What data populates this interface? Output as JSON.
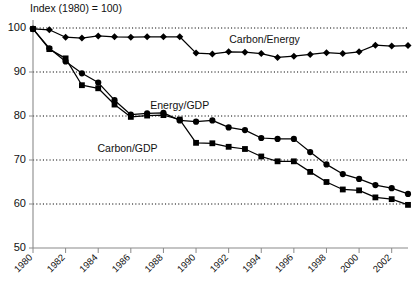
{
  "chart_data": {
    "type": "line",
    "title": "Index (1980) = 100)",
    "xlabel": "",
    "ylabel": "",
    "ylim": [
      50,
      100
    ],
    "xlim": [
      1980,
      2003
    ],
    "grid": true,
    "gridlines_y": [
      60,
      70,
      80,
      90,
      100
    ],
    "y_ticks": [
      50,
      60,
      70,
      80,
      90,
      100
    ],
    "y_tick_labels": [
      "50",
      "60",
      "70",
      "80",
      "90",
      "100"
    ],
    "x_ticks": [
      1980,
      1982,
      1984,
      1986,
      1988,
      1990,
      1992,
      1994,
      1996,
      1998,
      2000,
      2002
    ],
    "x_tick_labels": [
      "1980",
      "1982",
      "1984",
      "1986",
      "1988",
      "1990",
      "1992",
      "1994",
      "1996",
      "1998",
      "2000",
      "2002"
    ],
    "x": [
      1980,
      1981,
      1982,
      1983,
      1984,
      1985,
      1986,
      1987,
      1988,
      1989,
      1990,
      1991,
      1992,
      1993,
      1994,
      1995,
      1996,
      1997,
      1998,
      1999,
      2000,
      2001,
      2002,
      2003
    ],
    "legend_position": "inline-annotations",
    "series": [
      {
        "name": "Carbon/Energy",
        "marker": "diamond",
        "label_x": 1994.2,
        "label_y": 96.7,
        "values": [
          99.8,
          99.6,
          97.9,
          97.7,
          98.2,
          98.0,
          97.9,
          98.0,
          98.0,
          98.0,
          94.3,
          94.1,
          94.6,
          94.5,
          94.2,
          93.3,
          93.6,
          94.0,
          94.4,
          94.2,
          94.6,
          96.1,
          95.9,
          96.0
        ]
      },
      {
        "name": "Energy/GDP",
        "marker": "circle",
        "label_x": 1989.0,
        "label_y": 81.6,
        "values": [
          99.8,
          95.4,
          92.4,
          89.7,
          87.6,
          83.6,
          80.3,
          80.6,
          80.7,
          79.0,
          78.7,
          79.0,
          77.4,
          76.8,
          75.0,
          74.8,
          74.8,
          71.8,
          69.0,
          66.8,
          65.7,
          64.3,
          63.6,
          62.3
        ]
      },
      {
        "name": "Carbon/GDP",
        "marker": "square",
        "label_x": 1985.8,
        "label_y": 71.9,
        "values": [
          99.8,
          95.2,
          93.1,
          87.0,
          86.3,
          82.6,
          79.8,
          80.1,
          80.2,
          79.2,
          73.9,
          73.8,
          73.0,
          72.5,
          70.8,
          69.7,
          69.7,
          67.3,
          65.0,
          63.3,
          63.1,
          61.5,
          61.1,
          59.8
        ]
      }
    ]
  }
}
